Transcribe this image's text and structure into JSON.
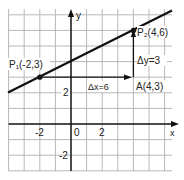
{
  "figure": {
    "axes": {
      "x_label": "x",
      "y_label": "y",
      "origin_label": "0",
      "x_ticks": [
        {
          "value": -2,
          "label": "-2"
        },
        {
          "value": 2,
          "label": "2"
        }
      ],
      "y_ticks": [
        {
          "value": 2,
          "label": "2"
        },
        {
          "value": -2,
          "label": "-2"
        }
      ],
      "x_range": [
        -4,
        6.5
      ],
      "y_range": [
        -3,
        7.3
      ]
    },
    "points": {
      "p1": {
        "label": "P₁(-2,3)",
        "x": -2,
        "y": 3
      },
      "p2": {
        "label": "P₂(4,6)",
        "x": 4,
        "y": 6
      },
      "a": {
        "label": "A(4,3)",
        "x": 4,
        "y": 3
      }
    },
    "annotations": {
      "dx": "Δx=6",
      "dy": "Δy=3"
    },
    "line": {
      "slope": 0.5,
      "intercept": 4
    },
    "colors": {
      "grid": "#b8b8b8",
      "ink": "#111111",
      "background": "#ffffff"
    }
  }
}
